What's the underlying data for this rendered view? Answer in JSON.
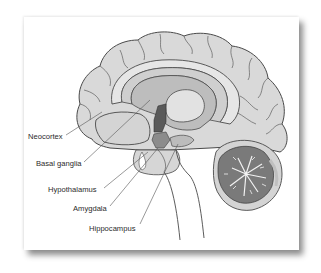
{
  "diagram": {
    "labels": [
      {
        "id": "neocortex",
        "text": "Neocortex"
      },
      {
        "id": "basal-ganglia",
        "text": "Basal ganglia"
      },
      {
        "id": "hypothalamus",
        "text": "Hypothalamus"
      },
      {
        "id": "amygdala",
        "text": "Amygdala"
      },
      {
        "id": "hippocampus",
        "text": "Hippocampus"
      }
    ],
    "colors": {
      "cortex": "#d9d9d9",
      "outline": "#4a4a4a",
      "corpus_callosum": "#e6e6e6",
      "ventricle": "#bdbdbd",
      "thalamus": "#dadada",
      "hypothalamus_dark": "#5a5a5a",
      "cerebellum": "#7a7a7a",
      "background": "#ffffff"
    }
  }
}
